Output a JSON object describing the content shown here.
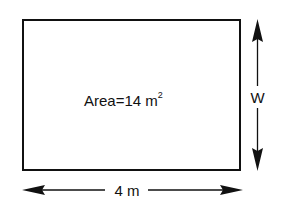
{
  "diagram": {
    "shape": "rectangle",
    "area_text": "Area=14 m",
    "area_exponent": "2",
    "width_label": "W",
    "length_label": "4 m",
    "colors": {
      "stroke": "#111111",
      "background": "#ffffff"
    }
  }
}
